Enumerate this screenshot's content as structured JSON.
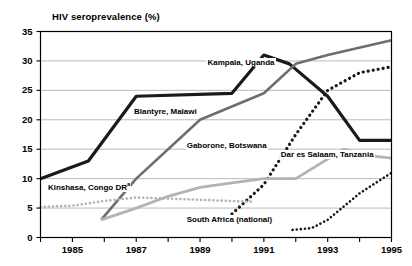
{
  "chart_data": {
    "type": "line",
    "title": "HIV seroprevalence (%)",
    "xlabel": "",
    "ylabel": "HIV seroprevalence (%)",
    "xlim": [
      1984,
      1995
    ],
    "ylim": [
      0,
      35
    ],
    "yticks": [
      0,
      5,
      10,
      15,
      20,
      25,
      30,
      35
    ],
    "xticks": [
      1984,
      1985,
      1986,
      1987,
      1988,
      1989,
      1990,
      1991,
      1992,
      1993,
      1994,
      1995
    ],
    "xtick_labels": [
      "1985",
      "1987",
      "1989",
      "1991",
      "1993",
      "1995"
    ],
    "xtick_label_years": [
      1985,
      1987,
      1989,
      1991,
      1993,
      1995
    ],
    "grid": "horizontal",
    "legend_position": "inline-annotations",
    "series": [
      {
        "name": "Kampala, Uganda",
        "style": "solid",
        "color": "#1a1a1a",
        "width": 3.2,
        "x": [
          1984,
          1985.5,
          1987,
          1990,
          1991,
          1991.8,
          1993,
          1994,
          1995
        ],
        "values": [
          10,
          13,
          24,
          24.5,
          31,
          29.5,
          24,
          16.5,
          16.5
        ]
      },
      {
        "name": "Blantyre, Malawi",
        "style": "solid",
        "color": "#6e6e6e",
        "width": 2.6,
        "x": [
          1985.9,
          1987,
          1989,
          1991,
          1992,
          1993,
          1995
        ],
        "values": [
          3,
          10,
          20,
          24.5,
          29.5,
          31,
          33.5
        ]
      },
      {
        "name": "Gaborone, Botswana",
        "style": "dotted",
        "color": "#1a1a1a",
        "width": 3.2,
        "x": [
          1990,
          1991,
          1992,
          1993,
          1994,
          1995
        ],
        "values": [
          4,
          9,
          17.5,
          25,
          28,
          29
        ]
      },
      {
        "name": "Dar es Salaam, Tanzania",
        "style": "solid",
        "color": "#b3b3b3",
        "width": 2.8,
        "x": [
          1985.9,
          1987,
          1988,
          1989,
          1990,
          1991,
          1992,
          1993.5,
          1994.5,
          1995
        ],
        "values": [
          3,
          5,
          7,
          8.5,
          9.3,
          10,
          10,
          15,
          13.8,
          13.5
        ]
      },
      {
        "name": "Kinshasa, Congo DR",
        "style": "dotted",
        "color": "#b3b3b3",
        "width": 2.6,
        "x": [
          1984,
          1985,
          1986,
          1987,
          1988,
          1989,
          1990,
          1990.6
        ],
        "values": [
          5.2,
          5.4,
          6.2,
          6.8,
          6.6,
          6.4,
          6.2,
          6.1
        ]
      },
      {
        "name": "South Africa (national)",
        "style": "dotted",
        "color": "#1a1a1a",
        "width": 2.6,
        "x": [
          1991.9,
          1992.5,
          1993,
          1994,
          1995
        ],
        "values": [
          1.3,
          1.6,
          3,
          7.5,
          11
        ]
      }
    ],
    "annotations": [
      {
        "text": "Kampala, Uganda",
        "x": 1989.2,
        "y": 29.6,
        "anchor": "start"
      },
      {
        "text": "Blantyre, Malawi",
        "x": 1986.9,
        "y": 21.3,
        "anchor": "start"
      },
      {
        "text": "Gaborone, Botswana",
        "x": 1988.55,
        "y": 15.6,
        "anchor": "start"
      },
      {
        "text": "Dar es Salaam, Tanzania",
        "x": 1991.5,
        "y": 14.1,
        "anchor": "start"
      },
      {
        "text": "Kinshasa, Congo DR",
        "superscript": "a",
        "x": 1984.2,
        "y": 8.4,
        "anchor": "start"
      },
      {
        "text": "South Africa (national)",
        "x": 1988.55,
        "y": 2.9,
        "anchor": "start"
      }
    ]
  }
}
